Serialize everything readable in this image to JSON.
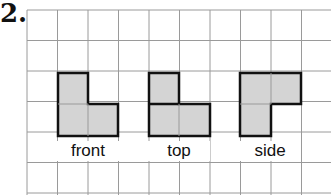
{
  "problem_number": "2.",
  "grid": {
    "cell_size": 30.5,
    "origin_x": 27,
    "origin_y": 10,
    "cols": 10,
    "rows": 6,
    "line_color": "#9a9a9a"
  },
  "views": [
    {
      "label": "front",
      "cells": [
        [
          1,
          2
        ],
        [
          1,
          3
        ],
        [
          2,
          3
        ]
      ]
    },
    {
      "label": "top",
      "cells": [
        [
          4,
          2
        ],
        [
          4,
          3
        ],
        [
          5,
          3
        ]
      ]
    },
    {
      "label": "side",
      "cells": [
        [
          7,
          2
        ],
        [
          8,
          2
        ],
        [
          7,
          3
        ]
      ]
    }
  ],
  "fill_color": "#d4d4d4",
  "outline_color": "#111111"
}
